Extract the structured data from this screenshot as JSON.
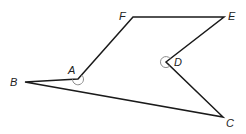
{
  "diagram": {
    "type": "polygon",
    "vertices": [
      {
        "name": "A",
        "x": 78,
        "y": 79,
        "label_x": 68,
        "label_y": 74
      },
      {
        "name": "B",
        "x": 25,
        "y": 82,
        "label_x": 10,
        "label_y": 86
      },
      {
        "name": "C",
        "x": 223,
        "y": 117,
        "label_x": 226,
        "label_y": 127
      },
      {
        "name": "D",
        "x": 166,
        "y": 62,
        "label_x": 174,
        "label_y": 66
      },
      {
        "name": "E",
        "x": 224,
        "y": 17,
        "label_x": 228,
        "label_y": 20
      },
      {
        "name": "F",
        "x": 133,
        "y": 17,
        "label_x": 119,
        "label_y": 20
      }
    ],
    "edges": [
      [
        "A",
        "B"
      ],
      [
        "B",
        "C"
      ],
      [
        "C",
        "D"
      ],
      [
        "D",
        "E"
      ],
      [
        "E",
        "F"
      ],
      [
        "F",
        "A"
      ]
    ],
    "angle_marks": [
      {
        "vertex": "A",
        "type": "reflex-arc"
      },
      {
        "vertex": "D",
        "type": "reflex-arc"
      }
    ],
    "colors": {
      "edge": "#1a1a1a",
      "arc": "#8a8a8a",
      "label": "#222222",
      "background": "#ffffff"
    }
  }
}
